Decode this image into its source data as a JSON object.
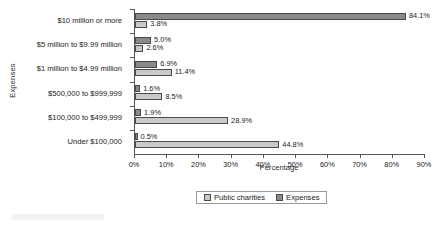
{
  "chart_data": {
    "type": "bar",
    "orientation": "horizontal",
    "title": "",
    "xlabel": "Percentage",
    "ylabel": "Expenses",
    "xlim": [
      0,
      90
    ],
    "xticks": [
      "0%",
      "10%",
      "20%",
      "30%",
      "40%",
      "50%",
      "60%",
      "70%",
      "80%",
      "90%"
    ],
    "xtick_values": [
      0,
      10,
      20,
      30,
      40,
      50,
      60,
      70,
      80,
      90
    ],
    "grid": false,
    "legend_position": "bottom-center",
    "categories": [
      "$10 million or more",
      "$5 million to $9.99 million",
      "$1 million to $4.99 million",
      "$500,000 to $999,999",
      "$100,000 to $499,999",
      "Under $100,000"
    ],
    "series": [
      {
        "name": "Expenses",
        "color": "#8a8a8a",
        "values": [
          84.1,
          5.0,
          6.9,
          1.6,
          1.9,
          0.5
        ],
        "labels": [
          "84.1%",
          "5.0%",
          "6.9%",
          "1.6%",
          "1.9%",
          "0.5%"
        ]
      },
      {
        "name": "Public charities",
        "color": "#c9c9c9",
        "values": [
          3.8,
          2.6,
          11.4,
          8.5,
          28.9,
          44.8
        ],
        "labels": [
          "3.8%",
          "2.6%",
          "11.4%",
          "8.5%",
          "28.9%",
          "44.8%"
        ]
      }
    ]
  },
  "legend": {
    "items": [
      {
        "label": "Public charities",
        "series": "charities"
      },
      {
        "label": "Expenses",
        "series": "expenses"
      }
    ]
  }
}
